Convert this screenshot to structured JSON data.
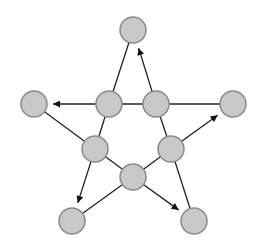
{
  "diagram": {
    "type": "graph",
    "colors": {
      "node_fill": "#c8c8c8",
      "node_stroke": "#8a8a8a",
      "edge": "#222222",
      "background": "#ffffff"
    },
    "node_radius": 13,
    "nodes": [
      {
        "id": "top",
        "x": 133,
        "y": 30
      },
      {
        "id": "left",
        "x": 34,
        "y": 104
      },
      {
        "id": "right",
        "x": 233,
        "y": 104
      },
      {
        "id": "inner_top_left",
        "x": 109,
        "y": 104
      },
      {
        "id": "inner_top_right",
        "x": 156,
        "y": 104
      },
      {
        "id": "inner_left",
        "x": 95,
        "y": 149
      },
      {
        "id": "inner_right",
        "x": 171,
        "y": 149
      },
      {
        "id": "inner_bottom",
        "x": 133,
        "y": 177
      },
      {
        "id": "bottom_left",
        "x": 72,
        "y": 221
      },
      {
        "id": "bottom_right",
        "x": 194,
        "y": 221
      }
    ],
    "edges": [
      {
        "from": "top",
        "to": "inner_top_left",
        "directed": false
      },
      {
        "from": "inner_top_right",
        "to": "top",
        "directed": true
      },
      {
        "from": "inner_top_left",
        "to": "left",
        "directed": true
      },
      {
        "from": "inner_top_left",
        "to": "inner_top_right",
        "directed": false
      },
      {
        "from": "inner_top_right",
        "to": "right",
        "directed": false
      },
      {
        "from": "left",
        "to": "inner_left",
        "directed": false
      },
      {
        "from": "inner_left",
        "to": "inner_top_left",
        "directed": false
      },
      {
        "from": "inner_right",
        "to": "right",
        "directed": true
      },
      {
        "from": "inner_top_right",
        "to": "inner_right",
        "directed": false
      },
      {
        "from": "inner_left",
        "to": "bottom_left",
        "directed": true
      },
      {
        "from": "inner_left",
        "to": "inner_bottom",
        "directed": false
      },
      {
        "from": "inner_bottom",
        "to": "inner_right",
        "directed": false
      },
      {
        "from": "inner_bottom",
        "to": "bottom_left",
        "directed": false
      },
      {
        "from": "inner_bottom",
        "to": "bottom_right",
        "directed": true
      },
      {
        "from": "inner_right",
        "to": "bottom_right",
        "directed": false
      }
    ]
  }
}
